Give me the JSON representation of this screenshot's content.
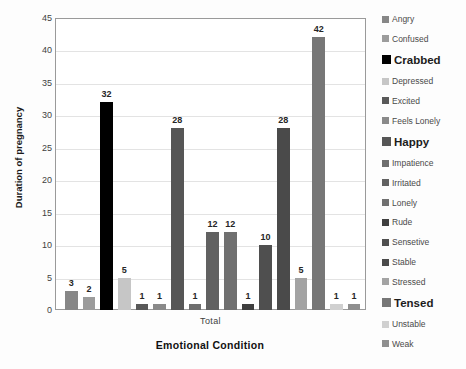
{
  "chart_data": {
    "type": "bar",
    "title": "",
    "xlabel": "Emotional Condition",
    "ylabel": "Duration of pregnancy",
    "x_group_label": "Total",
    "ylim": [
      0,
      45
    ],
    "ytick_step": 5,
    "yticks": [
      "0",
      "5",
      "10",
      "15",
      "20",
      "25",
      "30",
      "35",
      "40",
      "45"
    ],
    "grid": true,
    "legend_position": "right",
    "categories": [
      "Total"
    ],
    "series": [
      {
        "name": "Angry",
        "value": 3,
        "color": "#878787",
        "emphasis": false
      },
      {
        "name": "Confused",
        "value": 2,
        "color": "#9c9c9c",
        "emphasis": false
      },
      {
        "name": "Crabbed",
        "value": 32,
        "color": "#000000",
        "emphasis": true
      },
      {
        "name": "Depressed",
        "value": 5,
        "color": "#c6c6c6",
        "emphasis": false
      },
      {
        "name": "Excited",
        "value": 1,
        "color": "#595959",
        "emphasis": false
      },
      {
        "name": "Feels Lonely",
        "value": 1,
        "color": "#8a8a8a",
        "emphasis": false
      },
      {
        "name": "Happy",
        "value": 28,
        "color": "#565656",
        "emphasis": true
      },
      {
        "name": "Impatience",
        "value": 1,
        "color": "#6e6e6e",
        "emphasis": false
      },
      {
        "name": "Irritated",
        "value": 12,
        "color": "#616161",
        "emphasis": false
      },
      {
        "name": "Lonely",
        "value": 12,
        "color": "#707070",
        "emphasis": false
      },
      {
        "name": "Rude",
        "value": 1,
        "color": "#3f3f3f",
        "emphasis": false
      },
      {
        "name": "Sensetive",
        "value": 10,
        "color": "#4f4f4f",
        "emphasis": false
      },
      {
        "name": "Stable",
        "value": 28,
        "color": "#4a4a4a",
        "emphasis": false
      },
      {
        "name": "Stressed",
        "value": 5,
        "color": "#a3a3a3",
        "emphasis": false
      },
      {
        "name": "Tensed",
        "value": 42,
        "color": "#777777",
        "emphasis": true
      },
      {
        "name": "Unstable",
        "value": 1,
        "color": "#d0d0d0",
        "emphasis": false
      },
      {
        "name": "Weak",
        "value": 1,
        "color": "#8f8f8f",
        "emphasis": false
      }
    ]
  }
}
